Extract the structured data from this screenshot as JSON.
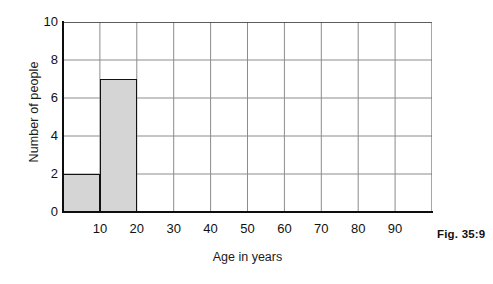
{
  "caption": "Fig. 35:9",
  "chart_data": {
    "type": "bar",
    "title": "",
    "xlabel": "Age in years",
    "ylabel": "Number of people",
    "xlim": [
      0,
      100
    ],
    "ylim": [
      0,
      10
    ],
    "grid": true,
    "legend": "none",
    "xticks": [
      10,
      20,
      30,
      40,
      50,
      60,
      70,
      80,
      90
    ],
    "yticks": [
      0,
      2,
      4,
      6,
      8,
      10
    ],
    "bin_width": 10,
    "bins": [
      {
        "label": "0-10",
        "start": 0,
        "end": 10,
        "value": 2
      },
      {
        "label": "10-20",
        "start": 10,
        "end": 20,
        "value": 7
      },
      {
        "label": "20-30",
        "start": 20,
        "end": 30,
        "value": 0
      },
      {
        "label": "30-40",
        "start": 30,
        "end": 40,
        "value": 0
      },
      {
        "label": "40-50",
        "start": 40,
        "end": 50,
        "value": 0
      },
      {
        "label": "50-60",
        "start": 50,
        "end": 60,
        "value": 0
      },
      {
        "label": "60-70",
        "start": 60,
        "end": 70,
        "value": 0
      },
      {
        "label": "70-80",
        "start": 70,
        "end": 80,
        "value": 0
      },
      {
        "label": "80-90",
        "start": 80,
        "end": 90,
        "value": 0
      },
      {
        "label": "90-100",
        "start": 90,
        "end": 100,
        "value": 0
      }
    ],
    "categories": [
      "0-10",
      "10-20",
      "20-30",
      "30-40",
      "40-50",
      "50-60",
      "60-70",
      "70-80",
      "80-90",
      "90-100"
    ],
    "values": [
      2,
      7,
      0,
      0,
      0,
      0,
      0,
      0,
      0,
      0
    ],
    "colors": {
      "bar_fill": "#d5d5d5",
      "bar_edge": "#121212",
      "axis": "#0d0d0d",
      "grid": "#8c8c8c",
      "background": "#ffffff"
    }
  }
}
